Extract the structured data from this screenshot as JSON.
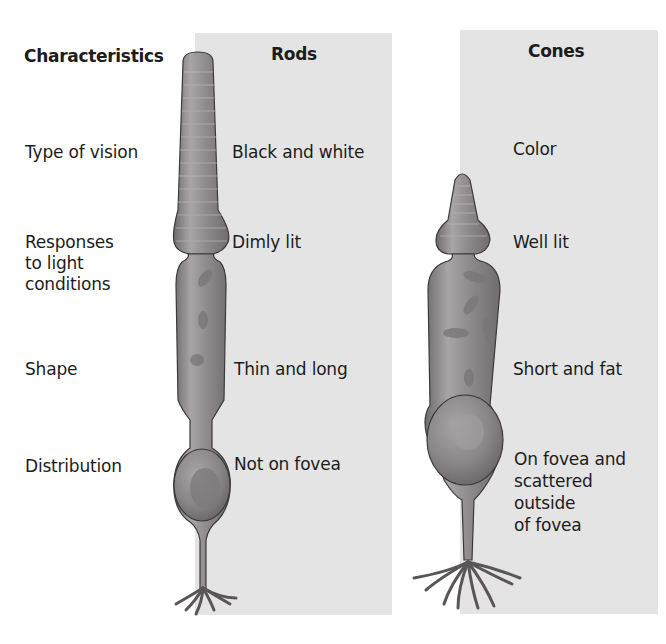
{
  "headers": {
    "characteristics": "Characteristics",
    "rods": "Rods",
    "cones": "Cones"
  },
  "rows": [
    {
      "label": [
        "Type of vision"
      ],
      "rods": [
        "Black and white"
      ],
      "cones": [
        "Color"
      ]
    },
    {
      "label": [
        "Responses",
        "to light",
        "conditions"
      ],
      "rods": [
        "Dimly lit"
      ],
      "cones": [
        "Well lit"
      ]
    },
    {
      "label": [
        "Shape"
      ],
      "rods": [
        "Thin and long"
      ],
      "cones": [
        "Short and fat"
      ]
    },
    {
      "label": [
        "Distribution"
      ],
      "rods": [
        "Not on fovea"
      ],
      "cones": [
        "On fovea and",
        "scattered",
        "outside",
        "of fovea"
      ]
    }
  ],
  "illustrations": {
    "rod": "rod-cell-illustration",
    "cone": "cone-cell-illustration"
  },
  "colors": {
    "panel": "#e4e4e4",
    "cell_fill": "#8e8a8c",
    "cell_outline": "#3a3a3a"
  }
}
